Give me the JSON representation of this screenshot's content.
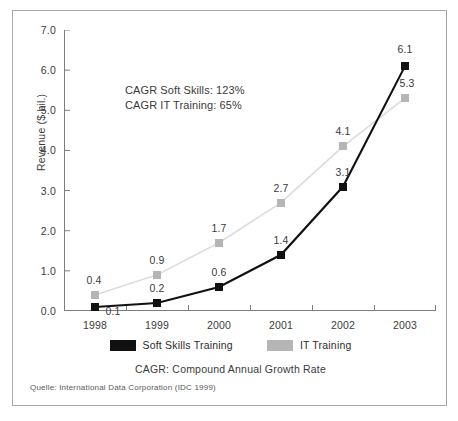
{
  "chart_data": {
    "type": "line",
    "title": "",
    "subtitle": "",
    "xlabel": "",
    "ylabel": "Revenue ($ bil.)",
    "categories": [
      "1998",
      "1999",
      "2000",
      "2001",
      "2002",
      "2003"
    ],
    "ylim": [
      0.0,
      7.0
    ],
    "yticks": [
      "0.0",
      "1.0",
      "2.0",
      "3.0",
      "4.0",
      "5.0",
      "6.0",
      "7.0"
    ],
    "ytick_values": [
      0.0,
      1.0,
      2.0,
      3.0,
      4.0,
      5.0,
      6.0,
      7.0
    ],
    "grid": false,
    "legend_position": "bottom",
    "series": [
      {
        "name": "Soft Skills Training",
        "color": "#111111",
        "marker": "square",
        "values": [
          0.1,
          0.2,
          0.6,
          1.4,
          3.1,
          6.1
        ],
        "labels": [
          "0.1",
          "0.2",
          "0.6",
          "1.4",
          "3.1",
          "6.1"
        ]
      },
      {
        "name": "IT Training",
        "color": "#b5b5b5",
        "line_color": "#dcdcdc",
        "marker": "square",
        "values": [
          0.4,
          0.9,
          1.7,
          2.7,
          4.1,
          5.3
        ],
        "labels": [
          "0.4",
          "0.9",
          "1.7",
          "2.7",
          "4.1",
          "5.3"
        ]
      }
    ],
    "annotations": [
      "CAGR Soft Skills: 123%",
      "CAGR IT Training: 65%"
    ],
    "legend_note": "CAGR: Compound Annual Growth Rate",
    "source": "Quelle: International Data Corporation (IDC 1999)"
  },
  "legend": {
    "items": [
      {
        "label": "Soft Skills Training",
        "color": "#111111"
      },
      {
        "label": "IT Training",
        "color": "#b5b5b5"
      }
    ]
  },
  "annotation": {
    "line1": "CAGR Soft Skills: 123%",
    "line2": "CAGR IT Training: 65%"
  },
  "footer": {
    "legend_note": "CAGR: Compound Annual Growth Rate",
    "source": "Quelle: International Data Corporation (IDC 1999)"
  },
  "axes": {
    "y_title": "Revenue ($ bil.)"
  }
}
